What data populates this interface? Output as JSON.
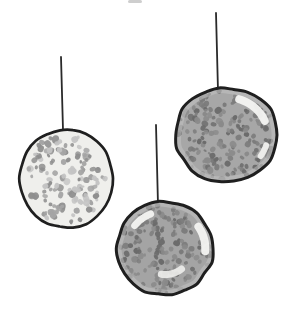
{
  "illustration": {
    "description": "Three hand-drawn speckled ball ornaments hanging from vertical strings on a white background",
    "background_color": "#ffffff",
    "outline_color": "#1f1f1f",
    "string_color": "#2a2a2a",
    "string_width": 1.8,
    "canvas": {
      "width": 286,
      "height": 314
    },
    "edge_artifact": {
      "x": 128,
      "y": 0,
      "width": 14,
      "height": 3,
      "color": "#b3b3b3",
      "opacity": 0.65
    },
    "ornaments": [
      {
        "id": "left-light-ball",
        "style": "light",
        "cx": 66.5,
        "cy": 178.5,
        "rx": 46.5,
        "ry": 49.5,
        "outline_width": 2.7,
        "base_color": "#efefec",
        "rim_color": "",
        "speckle_colors": [
          "#8e8e8e",
          "#a4a4a4",
          "#c3c3c3"
        ],
        "speckle_count": 140,
        "speckle_min": 1.8,
        "speckle_max": 3.6,
        "speckle_spread": 0.9,
        "seed": 11,
        "string": {
          "x1": 61,
          "y1": 57,
          "x2": 63,
          "y2": 130
        },
        "highlights": []
      },
      {
        "id": "top-right-gray-ball",
        "style": "dark",
        "cx": 226.5,
        "cy": 135,
        "rx": 51.5,
        "ry": 47,
        "outline_width": 3.0,
        "base_color": "#a7a7a7",
        "rim_color": "#c9c9c9",
        "speckle_colors": [
          "#6b6b6b",
          "#7b7b7b",
          "#8a8a8a"
        ],
        "speckle_count": 175,
        "speckle_min": 1.6,
        "speckle_max": 3.2,
        "speckle_spread": 0.95,
        "seed": 23,
        "string": {
          "x1": 216,
          "y1": 13,
          "x2": 218,
          "y2": 91
        },
        "highlights": [
          {
            "start": -72,
            "end": -22,
            "r": 0.8,
            "w": 8,
            "color": "#f4f4f2",
            "opacity": 0.95
          },
          {
            "start": 16,
            "end": 34,
            "r": 0.8,
            "w": 6,
            "color": "#f4f4f2",
            "opacity": 0.9
          }
        ]
      },
      {
        "id": "bottom-middle-gray-ball",
        "style": "dark",
        "cx": 165,
        "cy": 248.5,
        "rx": 48,
        "ry": 46.5,
        "outline_width": 3.0,
        "base_color": "#a4a4a4",
        "rim_color": "#c9c9c9",
        "speckle_colors": [
          "#6b6b6b",
          "#7b7b7b",
          "#8a8a8a"
        ],
        "speckle_count": 170,
        "speckle_min": 1.6,
        "speckle_max": 3.2,
        "speckle_spread": 0.95,
        "seed": 37,
        "string": {
          "x1": 156,
          "y1": 125,
          "x2": 158,
          "y2": 205
        },
        "highlights": [
          {
            "start": -142,
            "end": -112,
            "r": 0.8,
            "w": 7,
            "color": "#f4f4f2",
            "opacity": 0.95
          },
          {
            "start": -34,
            "end": 4,
            "r": 0.84,
            "w": 8,
            "color": "#f4f4f2",
            "opacity": 0.95
          },
          {
            "start": 52,
            "end": 98,
            "r": 0.56,
            "w": 7,
            "color": "#eeeeec",
            "opacity": 0.9
          }
        ]
      }
    ]
  }
}
